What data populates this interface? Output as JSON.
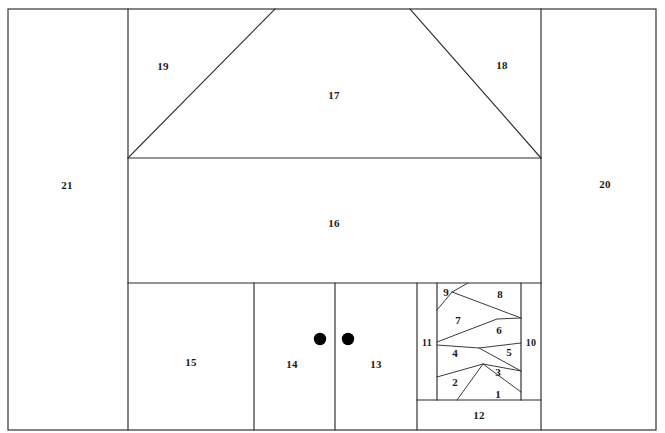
{
  "figure": {
    "background_color": "#ffffff",
    "line_color": "#2b2b2b",
    "label_color": "#1a1a1a",
    "width": 665,
    "height": 433,
    "marker_color": "#000000"
  },
  "regions": [
    {
      "id": "1",
      "label": "1",
      "x": 498,
      "y": 395
    },
    {
      "id": "2",
      "label": "2",
      "x": 455,
      "y": 383
    },
    {
      "id": "3",
      "label": "3",
      "x": 498,
      "y": 373
    },
    {
      "id": "4",
      "label": "4",
      "x": 455,
      "y": 354
    },
    {
      "id": "5",
      "label": "5",
      "x": 509,
      "y": 353
    },
    {
      "id": "6",
      "label": "6",
      "x": 499,
      "y": 331
    },
    {
      "id": "7",
      "label": "7",
      "x": 458,
      "y": 321
    },
    {
      "id": "8",
      "label": "8",
      "x": 500,
      "y": 295
    },
    {
      "id": "9",
      "label": "9",
      "x": 446,
      "y": 293
    },
    {
      "id": "10",
      "label": "10",
      "x": 531,
      "y": 344
    },
    {
      "id": "11",
      "label": "11",
      "x": 427,
      "y": 344
    },
    {
      "id": "12",
      "label": "12",
      "x": 479,
      "y": 416
    },
    {
      "id": "13",
      "label": "13",
      "x": 376,
      "y": 365
    },
    {
      "id": "14",
      "label": "14",
      "x": 292,
      "y": 365
    },
    {
      "id": "15",
      "label": "15",
      "x": 191,
      "y": 363
    },
    {
      "id": "16",
      "label": "16",
      "x": 334,
      "y": 224
    },
    {
      "id": "17",
      "label": "17",
      "x": 334,
      "y": 96
    },
    {
      "id": "18",
      "label": "18",
      "x": 502,
      "y": 66
    },
    {
      "id": "19",
      "label": "19",
      "x": 163,
      "y": 67
    },
    {
      "id": "20",
      "label": "20",
      "x": 605,
      "y": 185
    },
    {
      "id": "21",
      "label": "21",
      "x": 67,
      "y": 186
    }
  ],
  "markers": [
    {
      "name": "door-marker-left",
      "cx": 320,
      "cy": 339,
      "r": 6.2
    },
    {
      "name": "door-marker-right",
      "cx": 348,
      "cy": 339,
      "r": 6.2
    }
  ],
  "geometry": {
    "outer_frame": {
      "x1": 8,
      "y1": 9,
      "x2": 656,
      "y2": 430
    },
    "left_column_divider_x": 128,
    "right_column_divider_x": 541,
    "eave_line_y": 158,
    "bottom_row_top_y": 283,
    "bottom_band_top_y": 400,
    "roof_apex_left_x": 275,
    "roof_apex_right_x": 410,
    "roof_top_y": 9,
    "bottom_divider_15_14_x": 254,
    "bottom_divider_14_13_x": 335,
    "zigzag_left_x": 437,
    "zigzag_right_x": 521,
    "col11_left_x": 417,
    "col10_right_x": 541
  }
}
